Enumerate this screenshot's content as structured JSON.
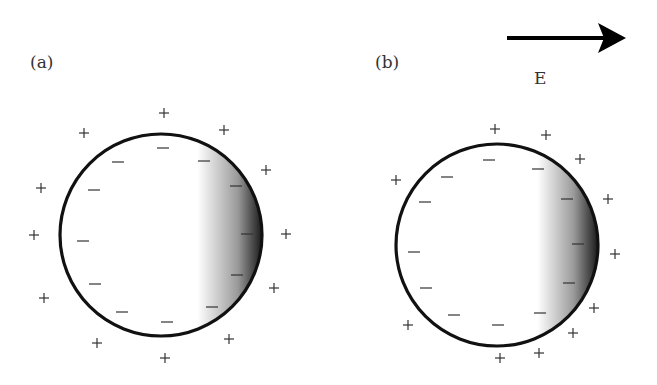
{
  "panels": [
    {
      "label": "(a)",
      "cx": 161,
      "cy": 235,
      "r": 101,
      "shade_start": 0.68,
      "inner_minus": [
        [
          163,
          148
        ],
        [
          118,
          162
        ],
        [
          204,
          161
        ],
        [
          94,
          190
        ],
        [
          236,
          186
        ],
        [
          83,
          241
        ],
        [
          247,
          234
        ],
        [
          95,
          284
        ],
        [
          237,
          275
        ],
        [
          122,
          312
        ],
        [
          212,
          307
        ],
        [
          167,
          322
        ]
      ],
      "outer_plus": [
        [
          164,
          113
        ],
        [
          84,
          133
        ],
        [
          224,
          130
        ],
        [
          41,
          188
        ],
        [
          266,
          170
        ],
        [
          34,
          235
        ],
        [
          286,
          234
        ],
        [
          44,
          298
        ],
        [
          274,
          288
        ],
        [
          97,
          343
        ],
        [
          229,
          339
        ],
        [
          165,
          358
        ]
      ]
    },
    {
      "label": "(b)",
      "cx": 497,
      "cy": 245,
      "r": 101,
      "shade_start": 0.7,
      "inner_minus": [
        [
          489,
          160
        ],
        [
          447,
          177
        ],
        [
          538,
          169
        ],
        [
          425,
          202
        ],
        [
          567,
          199
        ],
        [
          414,
          252
        ],
        [
          578,
          244
        ],
        [
          426,
          288
        ],
        [
          569,
          283
        ],
        [
          454,
          315
        ],
        [
          540,
          313
        ],
        [
          498,
          325
        ]
      ],
      "outer_plus": [
        [
          495,
          129
        ],
        [
          546,
          135
        ],
        [
          580,
          159
        ],
        [
          396,
          180
        ],
        [
          608,
          199
        ],
        [
          615,
          254
        ],
        [
          408,
          325
        ],
        [
          594,
          308
        ],
        [
          573,
          333
        ],
        [
          500,
          358
        ],
        [
          539,
          353
        ]
      ]
    }
  ],
  "field": {
    "label": "E",
    "arrow_x1": 507,
    "arrow_x2": 626,
    "arrow_y": 38,
    "color": "#000000"
  },
  "symbols": {
    "plus": "+",
    "minus": "−"
  }
}
